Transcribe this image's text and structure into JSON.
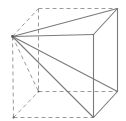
{
  "diagram": {
    "type": "geometry",
    "colors": {
      "solid_edge": "#7a7a7a",
      "hidden_edge": "#9a9a9a",
      "background": "#ffffff"
    },
    "vertices": {
      "apex": [
        12,
        36
      ],
      "back_top_left": [
        38,
        8
      ],
      "back_top_right": [
        117,
        8
      ],
      "back_bottom_left": [
        38,
        91
      ],
      "back_bottom_right": [
        117,
        91
      ],
      "front_top_right": [
        93,
        34
      ],
      "front_bottom_left": [
        13,
        117
      ],
      "front_bottom_right": [
        93,
        117
      ]
    },
    "solid_edges": [
      [
        "apex",
        "back_top_right"
      ],
      [
        "apex",
        "front_top_right"
      ],
      [
        "front_top_right",
        "back_top_right"
      ],
      [
        "back_top_right",
        "back_bottom_right"
      ],
      [
        "front_top_right",
        "front_bottom_right"
      ],
      [
        "front_bottom_right",
        "back_bottom_right"
      ],
      [
        "apex",
        "back_bottom_right"
      ],
      [
        "apex",
        "front_bottom_right"
      ]
    ],
    "dashed_edges": [
      [
        "back_top_left",
        "back_top_right"
      ],
      [
        "apex",
        "back_top_left"
      ],
      [
        "back_top_left",
        "back_bottom_left"
      ],
      [
        "back_bottom_left",
        "back_bottom_right"
      ],
      [
        "apex",
        "front_bottom_left"
      ],
      [
        "front_bottom_left",
        "front_bottom_right"
      ],
      [
        "front_bottom_left",
        "back_bottom_left"
      ],
      [
        "apex",
        "back_bottom_left"
      ]
    ]
  }
}
